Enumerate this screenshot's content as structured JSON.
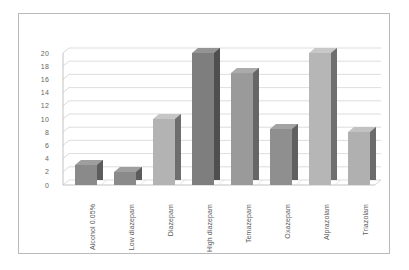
{
  "chart_data": {
    "type": "bar",
    "title": "",
    "subtitle": "",
    "xlabel": "",
    "ylabel": "",
    "categories": [
      "Alcohol 0.05%",
      "Low diazepam",
      "Diazepam",
      "High diazepam",
      "Temazepam",
      "Oxazepam",
      "Alprazolam",
      "Triazolam"
    ],
    "values": [
      3,
      2,
      10,
      20,
      17,
      8.5,
      20,
      8
    ],
    "ylim": [
      0,
      20
    ],
    "ytick_labels": [
      "20",
      "18",
      "16",
      "14",
      "12",
      "10",
      "8",
      "6",
      "4",
      "2",
      "0"
    ],
    "ytick_values": [
      20,
      18,
      16,
      14,
      12,
      10,
      8,
      6,
      4,
      2,
      0
    ],
    "ytick_step": 2,
    "grid": true,
    "legend": "none",
    "style": "3d-column",
    "bar_colors": [
      "#8a8a8a",
      "#8a8a8a",
      "#b3b3b3",
      "#7e7e7e",
      "#9a9a9a",
      "#8f8f8f",
      "#b6b6b6",
      "#b0b0b0"
    ],
    "bar_side_colors": [
      "#5c5c5c",
      "#5c5c5c",
      "#6e6e6e",
      "#4f4f4f",
      "#666666",
      "#606060",
      "#6f6f6f",
      "#6b6b6b"
    ],
    "bar_top_colors": [
      "#9e9e9e",
      "#9e9e9e",
      "#c6c6c6",
      "#949494",
      "#ababab",
      "#a3a3a3",
      "#c8c8c8",
      "#c2c2c2"
    ]
  },
  "frame": {
    "border_color": "#b9b9b9",
    "background": "#ffffff",
    "gridline_color": "#d2d2d2",
    "axis_color": "#bcbcbc",
    "tick_text_color": "#666666",
    "category_text_color": "#5a5a5a"
  }
}
